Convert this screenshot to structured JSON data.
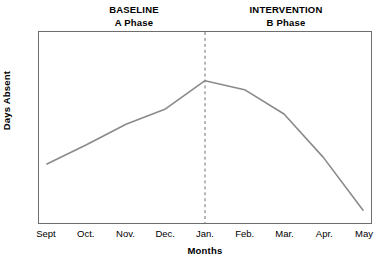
{
  "chart_data": {
    "type": "line",
    "title": "",
    "xlabel": "Months",
    "ylabel": "Days Absent",
    "categories": [
      "Sept",
      "Oct.",
      "Nov.",
      "Dec.",
      "Jan.",
      "Feb.",
      "Mar.",
      "Apr.",
      "May"
    ],
    "series": [
      {
        "name": "Days Absent",
        "values": [
          3.1,
          4.6,
          6.2,
          7.4,
          9.6,
          8.9,
          7.0,
          3.6,
          -0.5
        ],
        "color": "#8a8a8a"
      }
    ],
    "ylim": [
      -1.5,
      13.4
    ],
    "yticks": [
      0,
      2,
      4,
      6,
      8,
      10,
      12
    ],
    "ytick_labels": [
      "0",
      "2",
      "4",
      "6",
      "8",
      "10",
      "12"
    ],
    "grid": false,
    "legend": "none",
    "annotations": [
      {
        "name": "phase-divider",
        "type": "vertical-dashed-line",
        "at_category": "Jan.",
        "color": "#6e6e6e"
      }
    ],
    "phase_labels": [
      {
        "title": "BASELINE",
        "subtitle": "A Phase",
        "side": "left"
      },
      {
        "title": "INTERVENTION",
        "subtitle": "B Phase",
        "side": "right"
      }
    ]
  },
  "headers": {
    "baseline": {
      "title": "BASELINE",
      "subtitle": "A Phase"
    },
    "intervention": {
      "title": "INTERVENTION",
      "subtitle": "B Phase"
    }
  },
  "axes": {
    "y_title": "Days Absent",
    "x_title": "Months"
  },
  "colors": {
    "line": "#8a8a8a",
    "frame": "#6e6e6e",
    "divider": "#6e6e6e",
    "text": "#000000",
    "background": "#ffffff"
  }
}
